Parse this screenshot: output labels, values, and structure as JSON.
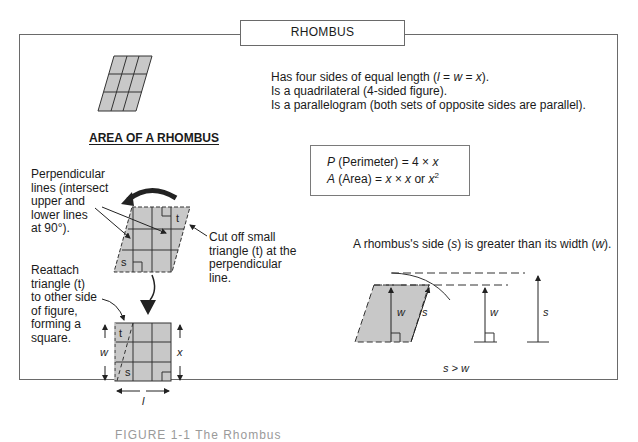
{
  "title": "RHOMBUS",
  "properties": [
    "Has four sides of equal length (l = w = x).",
    "Is a quadrilateral (4-sided figure).",
    "Is a parallelogram (both sets of opposite sides are parallel)."
  ],
  "area_section": {
    "heading": "AREA OF A RHOMBUS",
    "perpendicular_note": [
      "Perpendicular",
      "lines (intersect",
      "upper and",
      "lower lines",
      "at 90°)."
    ],
    "cut_note": [
      "Cut off small",
      "triangle (t) at the",
      "perpendicular",
      "line."
    ],
    "reattach_note": [
      "Reattach",
      "triangle (t)",
      "to other side",
      "of figure,",
      "forming a",
      "square."
    ],
    "labels": {
      "t": "t",
      "s": "s",
      "w": "w",
      "x": "x",
      "l": "l"
    }
  },
  "formulas": {
    "perimeter_var": "P",
    "perimeter_text": " (Perimeter) = 4 × ",
    "perimeter_x": "x",
    "area_var": "A",
    "area_text": " (Area) = ",
    "area_expr": "x × x",
    "area_or": " or ",
    "area_sq": "x",
    "area_exp": "2"
  },
  "side_vs_width": {
    "statement": "A rhombus's side (s) is greater than its width (w).",
    "labels": {
      "w": "w",
      "s": "s"
    },
    "inequality": "s > w"
  },
  "caption": "FIGURE 1-1   The Rhombus",
  "colors": {
    "fill": "#c8c8c8",
    "line": "#2a2a2a",
    "frame": "#6a6a6a"
  }
}
